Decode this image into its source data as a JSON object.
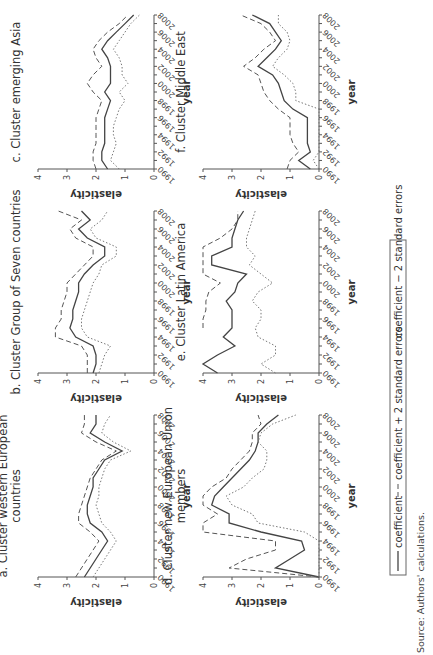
{
  "figure": {
    "legend": {
      "coefficient": "coefficient",
      "plus": "coefficient + 2 standard errors",
      "minus": "coefficient − 2 standard errors"
    },
    "source": "Source: Authors' calculations.",
    "ylabel": "elasticity",
    "xlabel": "year",
    "colors": {
      "line": "#444444",
      "axis": "#555555",
      "text": "#333333"
    }
  },
  "chart_data": [
    {
      "type": "line",
      "id": "a",
      "title": "a. Cluster western European countries",
      "xlabel": "year",
      "ylabel": "elasticity",
      "ylim": [
        0,
        4
      ],
      "x": [
        1990,
        1991,
        1992,
        1993,
        1994,
        1995,
        1996,
        1997,
        1998,
        1999,
        2000,
        2001,
        2002,
        2003,
        2004,
        2005,
        2006,
        2007,
        2008
      ],
      "series": [
        {
          "name": "coefficient",
          "values": [
            2.4,
            2.2,
            2.0,
            1.8,
            1.6,
            1.8,
            2.2,
            2.3,
            2.3,
            2.2,
            2.1,
            2.1,
            1.9,
            1.7,
            1.1,
            1.7,
            2.2,
            2.0,
            2.0
          ]
        },
        {
          "name": "coefficient + 2 standard errors",
          "values": [
            2.7,
            2.5,
            2.3,
            2.1,
            1.9,
            2.2,
            2.6,
            2.6,
            2.5,
            2.4,
            2.3,
            2.2,
            2.0,
            1.8,
            1.3,
            2.0,
            2.5,
            2.4,
            2.4
          ]
        },
        {
          "name": "coefficient - 2 standard errors",
          "values": [
            2.1,
            1.9,
            1.7,
            1.5,
            1.3,
            1.5,
            1.8,
            1.9,
            2.0,
            1.9,
            1.9,
            1.8,
            1.7,
            1.5,
            0.8,
            1.4,
            1.8,
            1.7,
            1.5
          ]
        }
      ]
    },
    {
      "type": "line",
      "id": "b",
      "title": "b. Cluster Group of Seven countries",
      "xlabel": "year",
      "ylabel": "elasticity",
      "ylim": [
        0,
        4
      ],
      "x": [
        1990,
        1991,
        1992,
        1993,
        1994,
        1995,
        1996,
        1997,
        1998,
        1999,
        2000,
        2001,
        2002,
        2003,
        2004,
        2005,
        2006,
        2007,
        2008
      ],
      "series": [
        {
          "name": "coefficient",
          "values": [
            2.1,
            2.0,
            2.0,
            2.1,
            2.7,
            2.9,
            2.8,
            2.8,
            2.7,
            2.6,
            2.6,
            2.4,
            2.1,
            1.7,
            1.7,
            2.3,
            2.6,
            2.2,
            2.5
          ]
        },
        {
          "name": "coefficient + 2 standard errors",
          "values": [
            2.3,
            2.3,
            2.3,
            2.5,
            3.4,
            3.4,
            3.2,
            3.2,
            3.1,
            3.0,
            3.0,
            2.7,
            2.4,
            2.1,
            2.1,
            2.7,
            2.9,
            2.5,
            3.3
          ]
        },
        {
          "name": "coefficient - 2 standard errors",
          "values": [
            1.9,
            1.8,
            1.7,
            1.5,
            2.3,
            2.5,
            2.5,
            2.4,
            2.3,
            2.2,
            2.1,
            1.9,
            1.8,
            1.3,
            1.3,
            2.0,
            2.2,
            1.8,
            1.6
          ]
        }
      ]
    },
    {
      "type": "line",
      "id": "c",
      "title": "c. Cluster emerging Asia",
      "xlabel": "year",
      "ylabel": "elasticity",
      "ylim": [
        0,
        4
      ],
      "x": [
        1990,
        1991,
        1992,
        1993,
        1994,
        1995,
        1996,
        1997,
        1998,
        1999,
        2000,
        2001,
        2002,
        2003,
        2004,
        2005,
        2006,
        2007,
        2008
      ],
      "series": [
        {
          "name": "coefficient",
          "values": [
            1.6,
            1.8,
            1.8,
            1.7,
            1.7,
            1.7,
            1.7,
            1.6,
            1.5,
            1.7,
            1.5,
            1.5,
            1.5,
            1.6,
            1.8,
            1.6,
            1.3,
            1.0,
            0.7
          ]
        },
        {
          "name": "coefficient + 2 standard errors",
          "values": [
            2.0,
            2.1,
            2.1,
            2.0,
            2.0,
            2.0,
            2.0,
            1.9,
            1.8,
            2.1,
            2.3,
            2.1,
            1.8,
            2.0,
            2.1,
            1.9,
            1.6,
            1.2,
            0.9
          ]
        },
        {
          "name": "coefficient - 2 standard errors",
          "values": [
            1.2,
            1.5,
            1.4,
            1.3,
            1.4,
            1.4,
            1.3,
            1.2,
            1.0,
            1.2,
            0.9,
            1.1,
            1.1,
            1.2,
            1.4,
            1.2,
            1.0,
            0.8,
            0.5
          ]
        }
      ]
    },
    {
      "type": "line",
      "id": "d",
      "title": "d. Cluster new European Union members",
      "xlabel": "year",
      "ylabel": "elasticity",
      "ylim": [
        0,
        4
      ],
      "x": [
        1990,
        1991,
        1992,
        1993,
        1994,
        1995,
        1996,
        1997,
        1998,
        1999,
        2000,
        2001,
        2002,
        2003,
        2004,
        2005,
        2006,
        2007,
        2008
      ],
      "series": [
        {
          "name": "coefficient",
          "values": [
            0.0,
            1.5,
            1.0,
            0.5,
            0.6,
            2.0,
            3.1,
            3.1,
            3.7,
            3.6,
            3.3,
            3.0,
            2.7,
            2.4,
            2.2,
            2.1,
            2.1,
            1.8,
            1.4
          ]
        },
        {
          "name": "coefficient + 2 standard errors",
          "values": [
            0.0,
            3.1,
            2.5,
            1.5,
            1.5,
            4.0,
            4.0,
            3.5,
            4.0,
            4.0,
            3.7,
            3.2,
            3.0,
            2.7,
            2.4,
            2.3,
            2.3,
            2.0,
            2.1
          ]
        },
        {
          "name": "coefficient - 2 standard errors",
          "values": [
            0.0,
            0.0,
            0.0,
            0.0,
            0.0,
            0.5,
            2.1,
            2.3,
            3.0,
            3.2,
            2.6,
            2.3,
            1.9,
            1.8,
            1.8,
            2.1,
            2.0,
            1.6,
            0.8
          ]
        }
      ]
    },
    {
      "type": "line",
      "id": "e",
      "title": "e. Cluster Latin America",
      "xlabel": "year",
      "ylabel": "elasticity",
      "ylim": [
        0,
        4
      ],
      "x": [
        1990,
        1991,
        1992,
        1993,
        1994,
        1995,
        1996,
        1997,
        1998,
        1999,
        2000,
        2001,
        2002,
        2003,
        2004,
        2005,
        2006,
        2007,
        2008
      ],
      "series": [
        {
          "name": "coefficient",
          "values": [
            3.5,
            4.0,
            3.5,
            2.9,
            3.3,
            3.0,
            3.0,
            3.0,
            3.2,
            2.9,
            2.8,
            2.5,
            3.7,
            3.7,
            3.0,
            3.0,
            2.9,
            2.8,
            2.6
          ]
        },
        {
          "name": "coefficient + 2 standard errors",
          "values": [
            null,
            null,
            null,
            null,
            null,
            4.0,
            4.0,
            3.9,
            3.9,
            3.8,
            3.4,
            4.0,
            4.0,
            4.0,
            4.0,
            3.4,
            3.0,
            2.8,
            2.8
          ]
        },
        {
          "name": "coefficient - 2 standard errors",
          "values": [
            1.5,
            2.0,
            1.5,
            1.5,
            2.1,
            2.2,
            2.0,
            2.0,
            2.3,
            2.1,
            1.6,
            2.0,
            2.4,
            2.2,
            2.5,
            2.5,
            2.4,
            2.3,
            2.2
          ]
        }
      ]
    },
    {
      "type": "line",
      "id": "f",
      "title": "f. Cluster Middle East",
      "xlabel": "year",
      "ylabel": "elasticity",
      "ylim": [
        0,
        4
      ],
      "x": [
        1990,
        1991,
        1992,
        1993,
        1994,
        1995,
        1996,
        1997,
        1998,
        1999,
        2000,
        2001,
        2002,
        2003,
        2004,
        2005,
        2006,
        2007,
        2008
      ],
      "series": [
        {
          "name": "coefficient",
          "values": [
            0.3,
            0.7,
            0.3,
            0.4,
            0.4,
            0.4,
            0.4,
            0.9,
            1.2,
            1.3,
            1.4,
            1.6,
            2.1,
            1.8,
            1.5,
            1.3,
            1.5,
            1.7,
            2.3
          ]
        },
        {
          "name": "coefficient + 2 standard errors",
          "values": [
            1.1,
            1.0,
            0.7,
            0.9,
            1.0,
            1.0,
            1.0,
            1.4,
            1.7,
            1.9,
            2.0,
            2.1,
            2.6,
            2.2,
            1.9,
            1.5,
            1.7,
            2.0,
            2.7
          ]
        },
        {
          "name": "coefficient - 2 standard errors",
          "values": [
            0.0,
            0.2,
            0.0,
            0.0,
            0.0,
            0.0,
            0.0,
            0.0,
            0.8,
            0.8,
            0.9,
            1.2,
            1.6,
            1.4,
            1.1,
            1.0,
            1.1,
            1.4,
            1.4
          ]
        }
      ]
    }
  ]
}
